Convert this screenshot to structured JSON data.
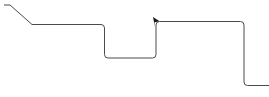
{
  "canvas": {
    "width": 269,
    "height": 97,
    "background_color": "#ffffff",
    "description": "Orthogonal connector line diagram"
  },
  "diagram": {
    "type": "connector-line",
    "stroke_color": "#4a4a4a",
    "stroke_width": 1,
    "marker_color": "#1a1a1a",
    "connector": {
      "name": "orthogonal-connector",
      "path": "M 4 5 L 10 5 L 32 24.5 L 101 24.5 Q 104.5 24.5 104.5 28 L 104.5 54.5 Q 104.5 58 108 58 L 152.5 58 Q 156 58 156 54.5 L 156 25 Q 156 21.5 159.5 21.5 L 240.5 21.5 Q 244 21.5 244 25 L 244 82 Q 244 85.5 247.5 85.5 L 269 85.5",
      "vertices": [
        {
          "x": 4,
          "y": 5
        },
        {
          "x": 10,
          "y": 5
        },
        {
          "x": 32,
          "y": 24.5
        },
        {
          "x": 104.5,
          "y": 24.5
        },
        {
          "x": 104.5,
          "y": 58
        },
        {
          "x": 156,
          "y": 58
        },
        {
          "x": 156,
          "y": 21.5
        },
        {
          "x": 244,
          "y": 21.5
        },
        {
          "x": 244,
          "y": 85.5
        },
        {
          "x": 269,
          "y": 85.5
        }
      ],
      "corner_radius": 3.5
    },
    "markers": [
      {
        "name": "arrow-marker",
        "x": 156,
        "y": 21.5,
        "points": "153.0,17.0 159.6,21.2 154.6,22.2 155.0,27.0",
        "direction": "down-left"
      }
    ]
  }
}
